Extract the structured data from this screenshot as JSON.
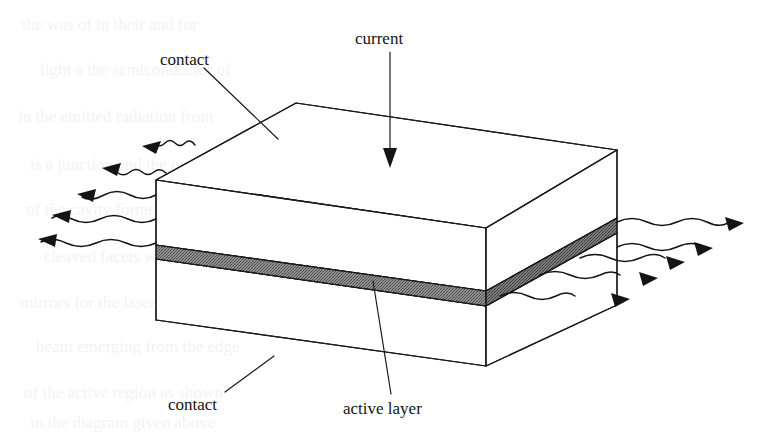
{
  "figure": {
    "background_color": "#ffffff",
    "ink_color": "#141414",
    "active_layer_fill": "#8a8a8a"
  },
  "labels": {
    "current": "current",
    "contact_top": "contact",
    "contact_bottom": "contact",
    "active_layer": "active layer"
  },
  "annotations": {
    "current_arrow": "down-arrow",
    "contact_top_leader": "leader-line",
    "contact_bottom_leader": "leader-line",
    "active_layer_leader": "leader-line"
  },
  "emission": {
    "left_label": "left-emission-beams",
    "left_count": 5,
    "right_label": "right-emission-beams",
    "right_count": 5,
    "beam_style": "wavy-arrow"
  },
  "geometry": {
    "box_note": "isometric slab with top contact layer, central active layer, bottom contact layer",
    "top_face": "156,180 296,103 617,150 486,228",
    "front_face": "156,180 486,228 486,366 156,320",
    "right_face": "486,228 617,150 617,305 486,366",
    "active_band_front": "156,245 486,291 486,306 156,259",
    "active_band_right": "486,291 617,218 617,233 486,306"
  }
}
